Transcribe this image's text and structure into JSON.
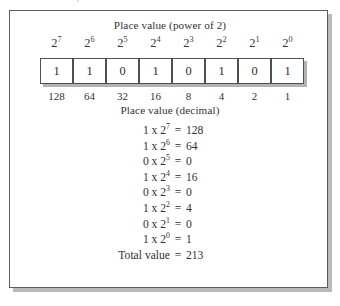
{
  "figure": {
    "caption_power": "Place value (power of 2)",
    "caption_decimal": "Place value (decimal)",
    "speck_mark": "'"
  },
  "chart_data": {
    "type": "table",
    "title": "Place value (power of 2)",
    "subtitle": "Place value (decimal)",
    "categories": [
      "2^7",
      "2^6",
      "2^5",
      "2^4",
      "2^3",
      "2^2",
      "2^1",
      "2^0"
    ],
    "exponents": [
      "7",
      "6",
      "5",
      "4",
      "3",
      "2",
      "1",
      "0"
    ],
    "base": "2",
    "bits": [
      "1",
      "1",
      "0",
      "1",
      "0",
      "1",
      "0",
      "1"
    ],
    "place_values": [
      "128",
      "64",
      "32",
      "16",
      "8",
      "4",
      "2",
      "1"
    ],
    "values": [
      128,
      64,
      0,
      16,
      0,
      4,
      0,
      1
    ],
    "total": 213
  },
  "equations": [
    {
      "left_bit": "1",
      "times": "x",
      "base": "2",
      "exp": "7",
      "op": "=",
      "result": "128"
    },
    {
      "left_bit": "1",
      "times": "x",
      "base": "2",
      "exp": "6",
      "op": "=",
      "result": "64"
    },
    {
      "left_bit": "0",
      "times": "x",
      "base": "2",
      "exp": "5",
      "op": "=",
      "result": "0"
    },
    {
      "left_bit": "1",
      "times": "x",
      "base": "2",
      "exp": "4",
      "op": "=",
      "result": "16"
    },
    {
      "left_bit": "0",
      "times": "x",
      "base": "2",
      "exp": "3",
      "op": "=",
      "result": "0"
    },
    {
      "left_bit": "1",
      "times": "x",
      "base": "2",
      "exp": "2",
      "op": "=",
      "result": "4"
    },
    {
      "left_bit": "0",
      "times": "x",
      "base": "2",
      "exp": "1",
      "op": "=",
      "result": "0"
    },
    {
      "left_bit": "1",
      "times": "x",
      "base": "2",
      "exp": "0",
      "op": "=",
      "result": "1"
    }
  ],
  "total": {
    "label": "Total value",
    "op": "=",
    "value": "213"
  },
  "colors": {
    "frame_border": "#5c5c5c",
    "frame_shadow": "#b9b9b9",
    "cell_border": "#4f4f4f",
    "text": "#303030"
  }
}
